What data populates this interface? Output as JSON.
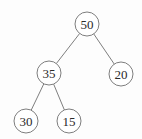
{
  "diagram": {
    "type": "binary-tree",
    "node_radius": 12,
    "colors": {
      "stroke": "#6f6f6f",
      "text": "#2a2a2a",
      "background": "#fdfdfd"
    },
    "nodes": [
      {
        "id": "n50",
        "label": "50",
        "x": 87,
        "y": 24
      },
      {
        "id": "n35",
        "label": "35",
        "x": 49,
        "y": 73
      },
      {
        "id": "n20",
        "label": "20",
        "x": 121,
        "y": 74
      },
      {
        "id": "n30",
        "label": "30",
        "x": 26,
        "y": 121
      },
      {
        "id": "n15",
        "label": "15",
        "x": 69,
        "y": 121
      }
    ],
    "edges": [
      {
        "from": "n50",
        "to": "n35"
      },
      {
        "from": "n50",
        "to": "n20"
      },
      {
        "from": "n35",
        "to": "n30"
      },
      {
        "from": "n35",
        "to": "n15"
      }
    ]
  }
}
